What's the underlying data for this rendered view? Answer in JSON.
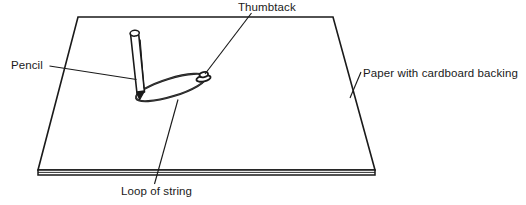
{
  "diagram": {
    "colors": {
      "stroke": "#1a1a1a",
      "background": "#ffffff",
      "text": "#1a1a1a"
    },
    "labels": {
      "thumbtack": "Thumbtack",
      "pencil": "Pencil",
      "paper": "Paper with cardboard backing",
      "loop_of_string": "Loop of string"
    },
    "objects": {
      "paper": "trapezoid sheet in perspective with cardboard thickness edge",
      "pencil": "upright pencil tilted with pointed tip down",
      "string": "elongated loop of string stretched between pencil tip and thumbtack",
      "thumbtack": "small thumbtack pinned through the string loop"
    }
  }
}
